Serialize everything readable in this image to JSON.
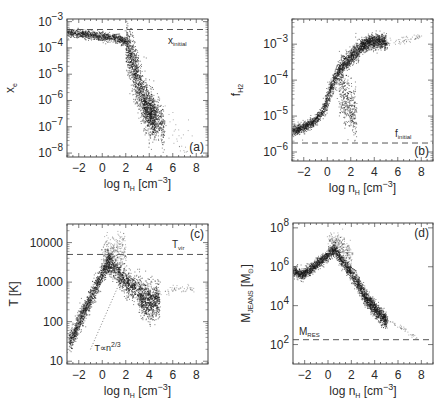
{
  "figure": {
    "background": "#ffffff",
    "ink": "#1a1a1a",
    "dash_color": "#555555"
  },
  "chart_data": [
    {
      "id": "a",
      "type": "scatter",
      "panel_label": "(a)",
      "xlabel": "log n_H [cm^-3]",
      "xlabel_parts": {
        "pre": "log n",
        "sub": "H",
        "mid": " [cm",
        "sup": "-3",
        "post": "]"
      },
      "ylabel": "x_e",
      "ylabel_parts": {
        "main": "x",
        "sub": "e"
      },
      "yscale": "log",
      "xlim": [
        -3,
        9
      ],
      "ylim_log10": [
        -2.9,
        -8.15
      ],
      "xticks": [
        -2,
        0,
        2,
        4,
        6,
        8
      ],
      "xtick_labels": [
        "−2",
        "0",
        "2",
        "4",
        "6",
        "8"
      ],
      "yticks_log10": [
        -3,
        -4,
        -5,
        -6,
        -7,
        -8
      ],
      "ytick_labels": [
        {
          "base": "10",
          "exp": "−3"
        },
        {
          "base": "10",
          "exp": "−4"
        },
        {
          "base": "10",
          "exp": "−5"
        },
        {
          "base": "10",
          "exp": "−6"
        },
        {
          "base": "10",
          "exp": "−7"
        },
        {
          "base": "10",
          "exp": "−8"
        }
      ],
      "hline": {
        "y_log10": -3.3,
        "label": "x_initial",
        "label_main": "x",
        "label_sub": "initial"
      },
      "frame": {
        "left": 67,
        "top": 19,
        "right": 208,
        "bottom": 157
      },
      "bands": [
        {
          "x": [
            -3.0,
            -1.0,
            1.0,
            2.0
          ],
          "y": [
            -3.4,
            -3.5,
            -3.6,
            -3.75
          ],
          "spread": 0.08,
          "n": 900
        },
        {
          "x": [
            2.0,
            2.6,
            3.2,
            3.8,
            4.5
          ],
          "y": [
            -3.8,
            -4.6,
            -5.6,
            -6.3,
            -6.8
          ],
          "spread": 0.45,
          "n": 1500
        },
        {
          "x": [
            3.5,
            4.5,
            5.2
          ],
          "y": [
            -6.2,
            -6.6,
            -7.0
          ],
          "spread": 0.35,
          "n": 500
        },
        {
          "x": [
            5.0,
            6.5,
            7.8
          ],
          "y": [
            -6.5,
            -7.3,
            -8.0
          ],
          "spread": 0.4,
          "n": 40,
          "faint": true
        }
      ]
    },
    {
      "id": "b",
      "type": "scatter",
      "panel_label": "(b)",
      "xlabel": "log n_H [cm^-3]",
      "xlabel_parts": {
        "pre": "log n",
        "sub": "H",
        "mid": " [cm",
        "sup": "-3",
        "post": "]"
      },
      "ylabel": "f_H2",
      "ylabel_parts": {
        "main": "f",
        "sub": "H2"
      },
      "yscale": "log",
      "xlim": [
        -3,
        9
      ],
      "ylim_log10": [
        -2.3,
        -6.25
      ],
      "xticks": [
        -2,
        0,
        2,
        4,
        6,
        8
      ],
      "xtick_labels": [
        "−2",
        "0",
        "2",
        "4",
        "6",
        "8"
      ],
      "yticks_log10": [
        -3,
        -4,
        -5,
        -6
      ],
      "ytick_labels": [
        {
          "base": "10",
          "exp": "−3"
        },
        {
          "base": "10",
          "exp": "−4"
        },
        {
          "base": "10",
          "exp": "−5"
        },
        {
          "base": "10",
          "exp": "−6"
        }
      ],
      "hline": {
        "y_log10": -5.75,
        "label": "f_initial",
        "label_main": "f",
        "label_sub": "initial"
      },
      "frame": {
        "left": 292,
        "top": 19,
        "right": 433,
        "bottom": 161
      },
      "bands": [
        {
          "x": [
            -3.0,
            -2.0,
            -1.0,
            -0.3
          ],
          "y": [
            -5.4,
            -5.3,
            -5.1,
            -4.8
          ],
          "spread": 0.07,
          "n": 700
        },
        {
          "x": [
            -0.3,
            0.3,
            1.0,
            1.8,
            2.8
          ],
          "y": [
            -4.8,
            -4.2,
            -3.7,
            -3.4,
            -3.1
          ],
          "spread": 0.12,
          "n": 1100
        },
        {
          "x": [
            2.8,
            3.5,
            4.3,
            5.0
          ],
          "y": [
            -3.05,
            -2.95,
            -2.9,
            -2.95
          ],
          "spread": 0.1,
          "n": 900
        },
        {
          "x": [
            1.0,
            1.8,
            2.4
          ],
          "y": [
            -4.2,
            -4.7,
            -5.0
          ],
          "spread": 0.35,
          "n": 400
        },
        {
          "x": [
            5.0,
            6.5,
            8.0
          ],
          "y": [
            -2.95,
            -2.9,
            -2.75
          ],
          "spread": 0.05,
          "n": 60,
          "faint": true
        }
      ]
    },
    {
      "id": "c",
      "type": "scatter",
      "panel_label": "(c)",
      "xlabel": "log n_H [cm^-3]",
      "xlabel_parts": {
        "pre": "log n",
        "sub": "H",
        "mid": " [cm",
        "sup": "-3",
        "post": "]"
      },
      "ylabel": "T [K]",
      "yscale": "log",
      "xlim": [
        -3,
        9
      ],
      "ylim_log10": [
        4.47,
        0.93
      ],
      "xticks": [
        -2,
        0,
        2,
        4,
        6,
        8
      ],
      "xtick_labels": [
        "−2",
        "0",
        "2",
        "4",
        "6",
        "8"
      ],
      "yticks_log10": [
        4,
        3,
        2,
        1
      ],
      "ytick_labels": [
        "10000",
        "1000",
        "100",
        "10"
      ],
      "hline": {
        "y_log10": 3.7,
        "label": "T_vir",
        "label_main": "T",
        "label_sub": "vir"
      },
      "annotation": {
        "text": "T ∝ n^2/3",
        "main": "T∝n",
        "sup": "2/3",
        "x": -1.0,
        "y_log10": 1.3
      },
      "dotted_line": {
        "x": [
          -1.0,
          1.5
        ],
        "y_log10": [
          1.3,
          3.0
        ]
      },
      "frame": {
        "left": 67,
        "top": 224,
        "right": 208,
        "bottom": 364
      },
      "bands": [
        {
          "x": [
            -2.8,
            -2.0,
            -1.0,
            0.0,
            0.6
          ],
          "y": [
            1.5,
            2.0,
            2.6,
            3.25,
            3.55
          ],
          "spread": 0.12,
          "n": 1200
        },
        {
          "x": [
            0.4,
            1.2,
            2.0,
            2.8
          ],
          "y": [
            3.55,
            3.3,
            3.0,
            2.85
          ],
          "spread": 0.15,
          "n": 800
        },
        {
          "x": [
            3.0,
            3.6,
            4.2,
            4.8
          ],
          "y": [
            2.75,
            2.55,
            2.5,
            2.6
          ],
          "spread": 0.22,
          "n": 900
        },
        {
          "x": [
            0.0,
            1.0,
            2.0
          ],
          "y": [
            3.7,
            3.8,
            3.75
          ],
          "spread": 0.2,
          "n": 300,
          "faint": true
        },
        {
          "x": [
            5.0,
            6.5,
            7.8
          ],
          "y": [
            2.75,
            2.85,
            2.85
          ],
          "spread": 0.05,
          "n": 50,
          "faint": true
        }
      ]
    },
    {
      "id": "d",
      "type": "scatter",
      "panel_label": "(d)",
      "xlabel": "log n_H [cm^-3]",
      "xlabel_parts": {
        "pre": "log n",
        "sub": "H",
        "mid": " [cm",
        "sup": "-3",
        "post": "]"
      },
      "ylabel": "M_JEANS [M_sun]",
      "ylabel_parts": {
        "main": "M",
        "sub": "JEANS",
        "rest": " [M",
        "rest_sub": "⊙",
        "end": "]"
      },
      "yscale": "log",
      "xlim": [
        -3,
        9
      ],
      "ylim_log10": [
        8.25,
        1.0
      ],
      "xticks": [
        -2,
        0,
        2,
        4,
        6,
        8
      ],
      "xtick_labels": [
        "−2",
        "0",
        "2",
        "4",
        "6",
        "8"
      ],
      "yticks_log10": [
        8,
        6,
        4,
        2
      ],
      "ytick_labels": [
        {
          "base": "10",
          "exp": "8"
        },
        {
          "base": "10",
          "exp": "6"
        },
        {
          "base": "10",
          "exp": "4"
        },
        {
          "base": "10",
          "exp": "2"
        }
      ],
      "hline": {
        "y_log10": 2.25,
        "label": "M_RES",
        "label_main": "M",
        "label_sub": "RES"
      },
      "frame": {
        "left": 293,
        "top": 223,
        "right": 433,
        "bottom": 364
      },
      "bands": [
        {
          "x": [
            -3.0,
            -2.3,
            -1.5,
            -0.5,
            0.5
          ],
          "y": [
            5.8,
            5.6,
            5.9,
            6.4,
            6.9
          ],
          "spread": 0.14,
          "n": 1100
        },
        {
          "x": [
            0.5,
            1.5,
            2.5,
            3.0
          ],
          "y": [
            6.9,
            6.1,
            5.2,
            4.6
          ],
          "spread": 0.18,
          "n": 800
        },
        {
          "x": [
            3.0,
            3.8,
            4.5,
            5.0
          ],
          "y": [
            4.6,
            4.0,
            3.5,
            3.2
          ],
          "spread": 0.2,
          "n": 900
        },
        {
          "x": [
            0.0,
            1.0,
            2.0
          ],
          "y": [
            7.3,
            7.2,
            6.5
          ],
          "spread": 0.25,
          "n": 250,
          "faint": true
        },
        {
          "x": [
            5.0,
            6.5,
            7.8
          ],
          "y": [
            3.3,
            2.8,
            2.3
          ],
          "spread": 0.05,
          "n": 40,
          "faint": true
        }
      ]
    }
  ]
}
